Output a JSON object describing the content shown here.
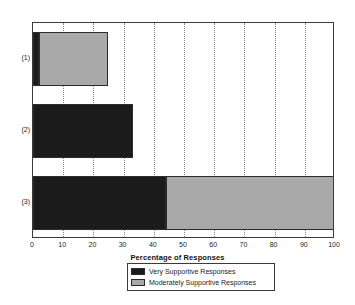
{
  "chart_data": {
    "type": "bar",
    "orientation": "horizontal",
    "stacked": true,
    "title": "",
    "xlabel": "Percentage of Responses",
    "ylabel": "",
    "xlim": [
      0,
      100
    ],
    "xticks": [
      0,
      10,
      20,
      30,
      40,
      50,
      60,
      70,
      80,
      90,
      100
    ],
    "xtick_labels": [
      "0",
      "10",
      "20",
      "30",
      "40",
      "50",
      "60",
      "70",
      "80",
      "90",
      "100"
    ],
    "categories": [
      "(1)",
      "(2)",
      "(3)"
    ],
    "grid": "vertical-dotted",
    "legend_position": "below-axis-center",
    "series": [
      {
        "name": "Very Supportive Responses",
        "color": "#1b1b1b",
        "values": [
          2,
          33,
          44
        ]
      },
      {
        "name": "Moderately Supportive Responses",
        "color": "#a9a9a9",
        "values": [
          23,
          0,
          56
        ]
      }
    ],
    "bar_totals": [
      25,
      33,
      100
    ]
  },
  "legend": {
    "items": [
      {
        "label": "Very Supportive Responses",
        "color": "#1b1b1b"
      },
      {
        "label": "Moderately Supportive Responses",
        "color": "#a9a9a9"
      }
    ]
  },
  "colors": {
    "very_supportive": "#1b1b1b",
    "moderately_supportive": "#a9a9a9",
    "axis": "#3a3a3a",
    "grid": "#8c8c8c",
    "background": "#ffffff"
  }
}
